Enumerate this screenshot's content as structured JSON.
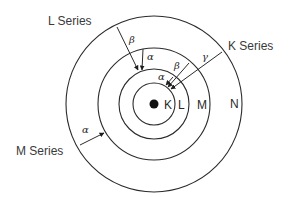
{
  "diagram": {
    "type": "atomic-shell-xray-transitions",
    "nucleus": {
      "cx": 154,
      "cy": 104,
      "r": 4.5
    },
    "shells": [
      {
        "id": "K",
        "label": "K",
        "r": 21,
        "label_x": 164,
        "label_y": 109
      },
      {
        "id": "L",
        "label": "L",
        "r": 35,
        "label_x": 178,
        "label_y": 109
      },
      {
        "id": "M",
        "label": "M",
        "r": 56,
        "label_x": 197,
        "label_y": 109
      },
      {
        "id": "N",
        "label": "N",
        "r": 88,
        "label_x": 230,
        "label_y": 108
      }
    ],
    "series": [
      {
        "name": "L Series",
        "label_x": 48,
        "label_y": 25,
        "transitions": [
          {
            "greek": "β",
            "from": "N",
            "to": "L",
            "x1": 117,
            "y1": 27,
            "x2": 138,
            "y2": 70,
            "gx": 129,
            "gy": 43
          },
          {
            "greek": "α",
            "from": "M",
            "to": "L",
            "x1": 143,
            "y1": 49,
            "x2": 142,
            "y2": 70,
            "gx": 147,
            "gy": 60
          }
        ]
      },
      {
        "name": "K Series",
        "label_x": 228,
        "label_y": 50,
        "transitions": [
          {
            "greek": "γ",
            "from": "N",
            "to": "K",
            "x1": 222,
            "y1": 52,
            "x2": 171,
            "y2": 89,
            "gx": 202,
            "gy": 60
          },
          {
            "greek": "β",
            "from": "M",
            "to": "K",
            "x1": 189,
            "y1": 63,
            "x2": 168,
            "y2": 87,
            "gx": 174,
            "gy": 69
          },
          {
            "greek": "α",
            "from": "L",
            "x1": 173,
            "y1": 77,
            "to": "K",
            "x2": 166,
            "y2": 85,
            "gx": 158,
            "gy": 80
          }
        ]
      },
      {
        "name": "M Series",
        "label_x": 16,
        "label_y": 155,
        "transitions": [
          {
            "greek": "α",
            "from": "N",
            "to": "M",
            "x1": 80,
            "y1": 145,
            "x2": 104,
            "y2": 133,
            "gx": 82,
            "gy": 133
          }
        ]
      }
    ]
  }
}
